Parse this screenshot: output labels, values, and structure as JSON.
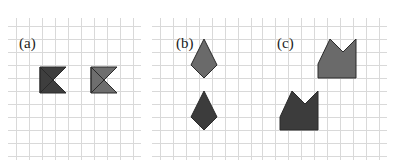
{
  "panels": [
    {
      "label": "(a)",
      "description": "Two bowtie shapes, left darker, right lighter",
      "grid": {
        "x0": 16,
        "y0": 26,
        "cols": 9,
        "rows": 10,
        "step": 13
      },
      "shapes": [
        {
          "name": "bowtie-dark",
          "fill": "#3e3e3e",
          "points": "40,67 53,80 40,93 40,67 66,67 53,80 66,93 40,93"
        },
        {
          "name": "bowtie-light",
          "fill": "#6e6e6e",
          "points": "91,67 104,80 91,93 91,67 117,67 104,80 117,93 91,93"
        }
      ]
    },
    {
      "label": "(b)",
      "description": "Two kite shapes stacked vertically, top lighter, bottom darker",
      "grid": {
        "x0": 160,
        "y0": 26,
        "cols": 7,
        "rows": 10,
        "step": 13
      },
      "shapes": [
        {
          "name": "kite-light",
          "fill": "#6a6a6a",
          "points": "204,39 217,65 204,78 191,65"
        },
        {
          "name": "kite-dark",
          "fill": "#3c3c3c",
          "points": "204,91 217,117 204,130 191,117"
        }
      ]
    },
    {
      "label": "(c)",
      "description": "Two crown/notched shapes, top-right lighter, bottom-left darker",
      "grid": {
        "x0": 262,
        "y0": 26,
        "cols": 9,
        "rows": 10,
        "step": 13
      },
      "shapes": [
        {
          "name": "crown-light",
          "fill": "#6a6a6a",
          "points": "318,64 330,39 343,52 356,39 356,78 318,78"
        },
        {
          "name": "crown-dark",
          "fill": "#3c3c3c",
          "points": "280,117 292,91 305,104 318,91 318,130 280,130"
        }
      ]
    }
  ],
  "colors": {
    "grid_line": "#d9d9d9",
    "outline": "#2a2a2a",
    "background": "#ffffff",
    "label": "#222222"
  }
}
